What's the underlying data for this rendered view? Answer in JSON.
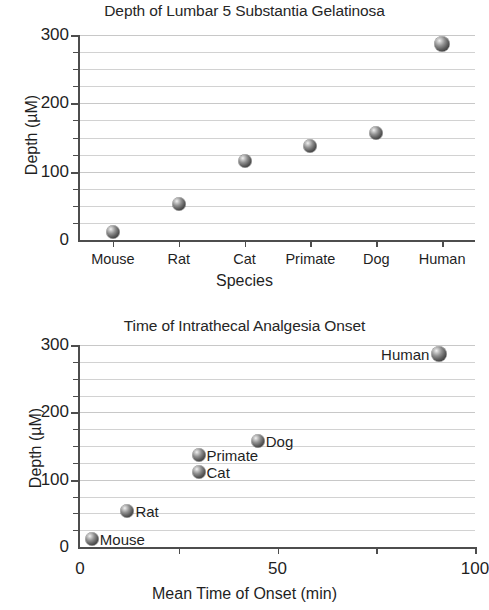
{
  "chart_data": [
    {
      "type": "scatter",
      "title": "Depth of Lumbar 5 Substantia Gelatinosa",
      "xlabel": "Species",
      "ylabel": "Depth (µM)",
      "categories": [
        "Mouse",
        "Rat",
        "Cat",
        "Primate",
        "Dog",
        "Human"
      ],
      "values": [
        12,
        53,
        115,
        138,
        157,
        287
      ],
      "ylim": [
        0,
        300
      ],
      "yticks_major": [
        0,
        100,
        200,
        300
      ],
      "ytick_labels": [
        "0",
        "100",
        "200",
        "300"
      ],
      "yticks_minor": [
        25,
        50,
        75,
        125,
        150,
        175,
        225,
        250,
        275
      ],
      "grid": true,
      "legend": "none",
      "marker": "3d-sphere-gray"
    },
    {
      "type": "scatter",
      "title": "Time of Intrathecal Analgesia Onset",
      "xlabel": "Mean Time of Onset (min)",
      "ylabel": "Depth (µM)",
      "xlim": [
        0,
        100
      ],
      "ylim": [
        0,
        300
      ],
      "xticks_major": [
        0,
        50,
        100
      ],
      "xtick_labels": [
        "0",
        "50",
        "100"
      ],
      "xticks_minor": [
        25,
        75
      ],
      "yticks_major": [
        0,
        100,
        200,
        300
      ],
      "ytick_labels": [
        "0",
        "100",
        "200",
        "300"
      ],
      "yticks_minor": [
        25,
        50,
        75,
        125,
        150,
        175,
        225,
        250,
        275
      ],
      "grid": true,
      "legend": "point-labels",
      "marker": "3d-sphere-gray",
      "points": [
        {
          "label": "Mouse",
          "x": 3,
          "y": 12,
          "label_side": "right"
        },
        {
          "label": "Rat",
          "x": 12,
          "y": 53,
          "label_side": "right"
        },
        {
          "label": "Cat",
          "x": 30,
          "y": 111,
          "label_side": "right"
        },
        {
          "label": "Primate",
          "x": 30,
          "y": 137,
          "label_side": "right"
        },
        {
          "label": "Dog",
          "x": 45,
          "y": 157,
          "label_side": "right"
        },
        {
          "label": "Human",
          "x": 91,
          "y": 287,
          "label_side": "left"
        }
      ]
    }
  ],
  "top_chart": {
    "title": "Depth of Lumbar 5 Substantia Gelatinosa",
    "x_axis_title": "Species",
    "y_axis_title": "Depth (µM)",
    "y_labels": [
      "300",
      "200",
      "100",
      "0"
    ],
    "category_labels": [
      "Mouse",
      "Rat",
      "Cat",
      "Primate",
      "Dog",
      "Human"
    ]
  },
  "bottom_chart": {
    "title": "Time of Intrathecal Analgesia Onset",
    "x_axis_title": "Mean Time of Onset (min)",
    "y_axis_title": "Depth (µM)",
    "y_labels": [
      "300",
      "200",
      "100",
      "0"
    ],
    "x_labels": [
      "0",
      "50",
      "100"
    ],
    "point_labels": [
      "Mouse",
      "Rat",
      "Cat",
      "Primate",
      "Dog",
      "Human"
    ]
  },
  "style": {
    "marker_color": "#4a4a4a",
    "grid_color": "#d2d2d2",
    "axis_color": "#4d4d4d",
    "text_color": "#1f1f1f",
    "background": "#ffffff"
  }
}
